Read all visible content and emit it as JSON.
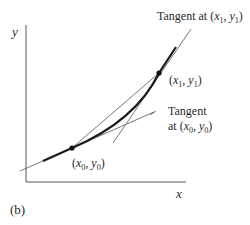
{
  "figure": {
    "panel_label": "(b)",
    "axes": {
      "x_label": "x",
      "y_label": "y"
    },
    "points": [
      {
        "id": "p0",
        "label_open": "(",
        "var_x": "x",
        "sub_x": "0",
        "sep": ", ",
        "var_y": "y",
        "sub_y": "0",
        "label_close": ")"
      },
      {
        "id": "p1",
        "label_open": "(",
        "var_x": "x",
        "sub_x": "1",
        "sep": ", ",
        "var_y": "y",
        "sub_y": "1",
        "label_close": ")"
      }
    ],
    "annotations": {
      "tangent_p1_prefix": "Tangent at (",
      "tangent_p0_line1": "Tangent",
      "tangent_p0_prefix": "at (",
      "close": ")",
      "comma": ", "
    },
    "colors": {
      "line": "#444444",
      "curve": "#1a1a1a",
      "text": "#2a2a2a"
    }
  }
}
